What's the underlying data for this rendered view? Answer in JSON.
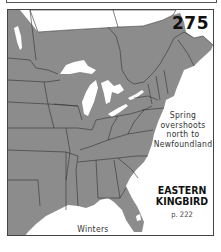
{
  "map": {
    "number": "275",
    "species": {
      "line1": "EASTERN",
      "line2": "KINGBIRD"
    },
    "page_ref": "p. 222",
    "notes": {
      "spring": {
        "line1": "Spring",
        "line2": "overshoots",
        "line3": "north to",
        "line4": "Newfoundland"
      },
      "winter": {
        "line1": "Winters",
        "line2": "S. America"
      }
    },
    "colors": {
      "range_fill": "#8c8c8c",
      "water": "#ffffff",
      "boundaries": "#333333",
      "frame": "#444444"
    },
    "legend": {
      "gray_area": "breeding range"
    }
  }
}
